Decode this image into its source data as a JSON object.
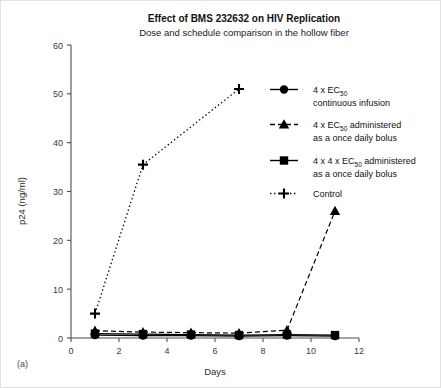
{
  "panel": {
    "label": "(a)"
  },
  "chart_data": {
    "type": "line",
    "title": "Effect of BMS 232632 on HIV Replication",
    "subtitle": "Dose and schedule comparison in the hollow fiber",
    "xlabel": "Days",
    "ylabel": "p24 (ng/ml)",
    "xlim": [
      0,
      12
    ],
    "ylim": [
      0,
      60
    ],
    "xticks": [
      0,
      2,
      4,
      6,
      8,
      10,
      12
    ],
    "yticks": [
      0,
      10,
      20,
      30,
      40,
      50,
      60
    ],
    "grid": false,
    "legend_position": "right",
    "series": [
      {
        "name": "4 x EC50 continuous infusion",
        "legend_line1": "4 x EC",
        "legend_sub1": "50",
        "legend_line1_tail": "",
        "legend_line2": "continuous infusion",
        "marker": "circle",
        "linestyle": "solid",
        "color": "#000000",
        "x": [
          1,
          3,
          5,
          7,
          9,
          11
        ],
        "y": [
          0.6,
          0.5,
          0.5,
          0.4,
          0.5,
          0.4
        ]
      },
      {
        "name": "4 x EC50 administered as a once daily bolus",
        "legend_line1": "4 x EC",
        "legend_sub1": "50",
        "legend_line1_tail": " administered",
        "legend_line2": "as a once daily bolus",
        "marker": "triangle",
        "linestyle": "dashed",
        "color": "#000000",
        "x": [
          1,
          3,
          5,
          7,
          9,
          11
        ],
        "y": [
          1.5,
          1.2,
          1.1,
          1.0,
          1.6,
          26.0
        ]
      },
      {
        "name": "4 x 4 x EC50 administered as a once daily bolus",
        "legend_line1": "4 x 4 x EC",
        "legend_sub1": "50",
        "legend_line1_tail": " administered",
        "legend_line2": "as a once daily bolus",
        "marker": "square",
        "linestyle": "solid",
        "color": "#000000",
        "x": [
          1,
          3,
          5,
          7,
          9,
          11
        ],
        "y": [
          0.9,
          0.8,
          0.7,
          0.6,
          0.7,
          0.6
        ]
      },
      {
        "name": "Control",
        "legend_line1": "Control",
        "legend_sub1": "",
        "legend_line1_tail": "",
        "legend_line2": "",
        "marker": "plus",
        "linestyle": "dotted",
        "color": "#000000",
        "x": [
          1,
          3,
          7
        ],
        "y": [
          5.0,
          35.5,
          51.0
        ]
      }
    ]
  }
}
